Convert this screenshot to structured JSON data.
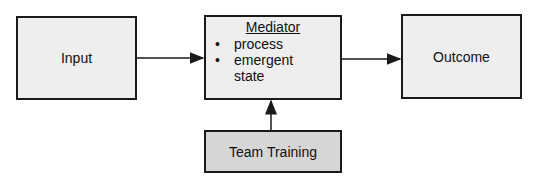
{
  "diagram": {
    "nodes": {
      "input": {
        "label": "Input"
      },
      "mediator": {
        "title": "Mediator",
        "items": [
          "process",
          "emergent state"
        ]
      },
      "outcome": {
        "label": "Outcome"
      },
      "training": {
        "label": "Team Training"
      }
    },
    "edges": [
      {
        "from": "Input",
        "to": "Mediator"
      },
      {
        "from": "Mediator",
        "to": "Outcome"
      },
      {
        "from": "Team Training",
        "to": "Mediator"
      }
    ],
    "colors": {
      "box_fill": "#eeeeee",
      "training_fill": "#d6d6d6",
      "stroke": "#1a1a1a"
    }
  }
}
